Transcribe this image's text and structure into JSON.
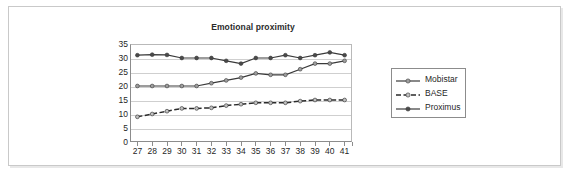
{
  "chart_data": {
    "type": "line",
    "title": "Emotional proximity",
    "xlabel": "",
    "ylabel": "",
    "ylim": [
      0,
      35
    ],
    "ytick_step": 5,
    "yticks": [
      35,
      30,
      25,
      20,
      15,
      10,
      5,
      0
    ],
    "grid": true,
    "legend_position": "right",
    "x": [
      27,
      28,
      29,
      30,
      31,
      32,
      33,
      34,
      35,
      36,
      37,
      38,
      39,
      40,
      41
    ],
    "categories": [
      "27",
      "28",
      "29",
      "30",
      "31",
      "32",
      "33",
      "34",
      "35",
      "36",
      "37",
      "38",
      "39",
      "40",
      "41"
    ],
    "series": [
      {
        "name": "Mobistar",
        "values": [
          20,
          20,
          20,
          20,
          20,
          21,
          22,
          23,
          24.5,
          24,
          24,
          26,
          28,
          28,
          29
        ],
        "color": "#3a3a3a",
        "marker_color": "#9e9e9e",
        "line_style": "solid"
      },
      {
        "name": "BASE",
        "values": [
          9,
          10,
          11,
          12,
          12,
          12.2,
          13,
          13.5,
          14,
          14,
          14,
          14.6,
          15,
          15,
          15
        ],
        "color": "#2b2b2b",
        "marker_color": "#c0c0c0",
        "line_style": "dashed"
      },
      {
        "name": "Proximus",
        "values": [
          31,
          31.2,
          31.1,
          30,
          30,
          30,
          29,
          28,
          30,
          30,
          31,
          30,
          31,
          32,
          31
        ],
        "color": "#3a3a3a",
        "marker_color": "#4a4a4a",
        "line_style": "solid"
      }
    ]
  },
  "legend": {
    "items": [
      {
        "label": "Mobistar"
      },
      {
        "label": "BASE"
      },
      {
        "label": "Proximus"
      }
    ]
  },
  "colors": {
    "plot_border": "#8c8c8c",
    "gridline": "#cfcfcf",
    "frame": "#c9c9c9",
    "text": "#1f1f1f",
    "background": "#ffffff"
  }
}
